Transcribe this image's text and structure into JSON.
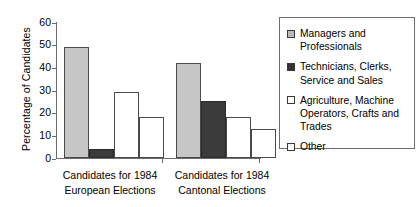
{
  "chart_data": {
    "type": "bar",
    "title": "",
    "xlabel": "",
    "ylabel": "Percentage of Candidates",
    "ylim": [
      0,
      60
    ],
    "yticks": [
      0,
      10,
      20,
      30,
      40,
      50,
      60
    ],
    "grid": false,
    "legend_position": "right",
    "categories": [
      "Candidates for 1984 European Elections",
      "Candidates for 1984 Cantonal Elections"
    ],
    "category_lines": [
      [
        "Candidates for 1984",
        "European Elections"
      ],
      [
        "Candidates for 1984",
        "Cantonal Elections"
      ]
    ],
    "series": [
      {
        "name": "Managers and Professionals",
        "name_lines": [
          "Managers and",
          "Professionals"
        ],
        "swatch": "light",
        "color": "#c6c6c6",
        "values": [
          49,
          42
        ]
      },
      {
        "name": "Technicians, Clerks, Service and Sales",
        "name_lines": [
          "Technicians, Clerks,",
          "Service and Sales"
        ],
        "swatch": "dark",
        "color": "#3b3b3b",
        "values": [
          4,
          25
        ]
      },
      {
        "name": "Agriculture, Machine Operators, Crafts and Trades",
        "name_lines": [
          "Agriculture, Machine",
          "Operators, Crafts and",
          "Trades"
        ],
        "swatch": "white",
        "color": "#ffffff",
        "values": [
          29,
          18
        ]
      },
      {
        "name": "Other",
        "name_lines": [
          "Other"
        ],
        "swatch": "white",
        "color": "#ffffff",
        "values": [
          18,
          13
        ]
      }
    ]
  },
  "legend": {
    "items": [
      {
        "label": "Managers and Professionals",
        "line1": "Managers and",
        "line2": "Professionals",
        "line3": ""
      },
      {
        "label": "Technicians, Clerks, Service and Sales",
        "line1": "Technicians, Clerks,",
        "line2": "Service and Sales",
        "line3": ""
      },
      {
        "label": "Agriculture, Machine Operators, Crafts and Trades",
        "line1": "Agriculture, Machine",
        "line2": "Operators, Crafts and",
        "line3": "Trades"
      },
      {
        "label": "Other",
        "line1": "Other",
        "line2": "",
        "line3": ""
      }
    ]
  },
  "axis": {
    "y_title": "Percentage of Candidates",
    "y_tick_labels": [
      "60",
      "50",
      "40",
      "30",
      "20",
      "10",
      "0"
    ]
  },
  "x_labels": {
    "group1_line1": "Candidates for 1984",
    "group1_line2": "European Elections",
    "group2_line1": "Candidates for 1984",
    "group2_line2": "Cantonal Elections"
  }
}
